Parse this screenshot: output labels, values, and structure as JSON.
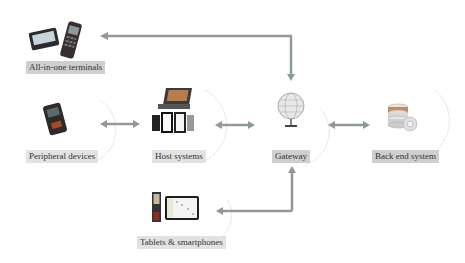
{
  "diagram": {
    "nodes": [
      {
        "id": "all-in-one",
        "label": "All-in-one terminals",
        "icon": "pos-terminal-icon"
      },
      {
        "id": "peripheral",
        "label": "Peripheral devices",
        "icon": "card-reader-icon"
      },
      {
        "id": "host",
        "label": "Host systems",
        "icon": "laptop-tablets-icon"
      },
      {
        "id": "gateway",
        "label": "Gateway",
        "icon": "globe-icon"
      },
      {
        "id": "backend",
        "label": "Back end system",
        "icon": "database-server-icon"
      },
      {
        "id": "tablets",
        "label": "Tablets & smartphones",
        "icon": "mobile-devices-icon"
      }
    ],
    "edges": [
      {
        "from": "gateway",
        "to": "all-in-one",
        "type": "elbow-bidirectional"
      },
      {
        "from": "peripheral",
        "to": "host",
        "type": "bidirectional"
      },
      {
        "from": "host",
        "to": "gateway",
        "type": "bidirectional"
      },
      {
        "from": "gateway",
        "to": "backend",
        "type": "bidirectional"
      },
      {
        "from": "gateway",
        "to": "tablets",
        "type": "elbow-bidirectional"
      }
    ],
    "colors": {
      "arrow": "#8f9a93",
      "label_bg": "#cfcfcf",
      "label_bg_light": "#e2e2e2",
      "circle": "#e6e6e6"
    }
  }
}
